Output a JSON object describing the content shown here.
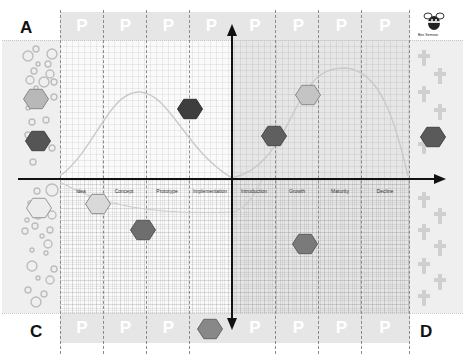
{
  "corners": {
    "top_left": "A",
    "top_right": "",
    "bottom_left": "C",
    "bottom_right": "D"
  },
  "top_band": {
    "cells": [
      "P",
      "P",
      "P",
      "P",
      "P",
      "P",
      "P",
      "P"
    ]
  },
  "bottom_band": {
    "cells": [
      "P",
      "P",
      "P",
      "",
      "P",
      "P",
      "P",
      "P"
    ]
  },
  "stages": [
    {
      "label": "Idea",
      "x": 81
    },
    {
      "label": "Concept",
      "x": 146
    },
    {
      "label": "Prototype",
      "x": 189
    },
    {
      "label": "Implementation",
      "x": 210
    },
    {
      "label": "Introduction",
      "x": 254
    },
    {
      "label": "Growth",
      "x": 297
    },
    {
      "label": "Maturity",
      "x": 341
    },
    {
      "label": "Decline",
      "x": 384
    }
  ],
  "logo": {
    "icon": "bee-mascot-icon",
    "caption": "Bee Seminar"
  },
  "hexagons": [
    {
      "id": "left-top",
      "cx": 36,
      "cy": 99,
      "fill": "#b8b8b8",
      "stroke": "#888888"
    },
    {
      "id": "left-mid",
      "cx": 38,
      "cy": 141,
      "fill": "#555555",
      "stroke": "#444444"
    },
    {
      "id": "left-bottom",
      "cx": 39,
      "cy": 208,
      "fill": "#ececec",
      "stroke": "#999999"
    },
    {
      "id": "idea",
      "cx": 98,
      "cy": 204,
      "fill": "#d9d9d9",
      "stroke": "#8a8a8a"
    },
    {
      "id": "concept-low",
      "cx": 143,
      "cy": 230,
      "fill": "#6e6e6e",
      "stroke": "#555555"
    },
    {
      "id": "implementation",
      "cx": 190,
      "cy": 109,
      "fill": "#3e3e3e",
      "stroke": "#2e2e2e"
    },
    {
      "id": "introduction",
      "cx": 274,
      "cy": 136,
      "fill": "#5f5f5f",
      "stroke": "#4a4a4a"
    },
    {
      "id": "growth-top",
      "cx": 308,
      "cy": 95,
      "fill": "#c4c4c4",
      "stroke": "#8a8a8a"
    },
    {
      "id": "growth-low",
      "cx": 305,
      "cy": 244,
      "fill": "#7a7a7a",
      "stroke": "#5c5c5c"
    },
    {
      "id": "right-mid",
      "cx": 433,
      "cy": 137,
      "fill": "#5a5a5a",
      "stroke": "#444444"
    },
    {
      "id": "bottom-band",
      "cx": 210,
      "cy": 329,
      "fill": "#888888",
      "stroke": "#666666"
    }
  ],
  "colors": {
    "axis": "#111111",
    "curve": "#c9c9c9",
    "band": "#e6e6e6",
    "side": "#efefef"
  }
}
